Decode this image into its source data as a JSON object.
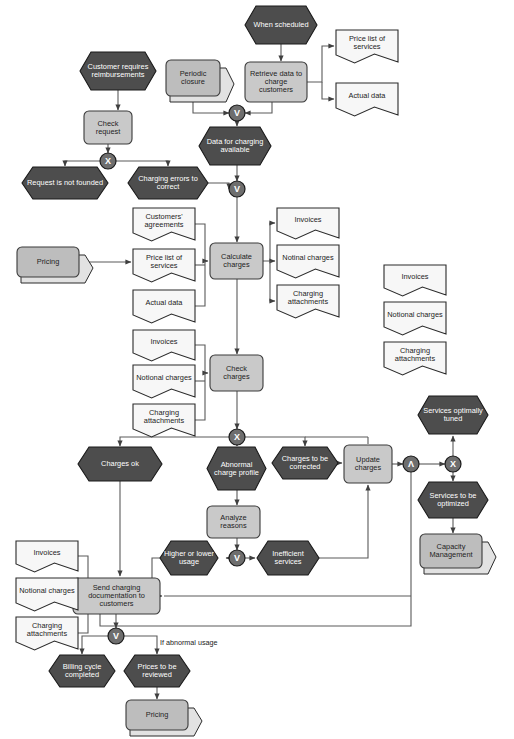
{
  "diagram": {
    "type": "event-driven-process-chain",
    "colors": {
      "event_fill": "#4d4d4d",
      "event_stroke": "#1a1a1a",
      "event_text": "#ffffff",
      "function_fill": "#c9c9c9",
      "function_stroke": "#3a3a3a",
      "function_text": "#1d1d1d",
      "document_fill": "#f7f7f7",
      "document_stroke": "#2b2b2b",
      "system_fill": "#bdbdbd",
      "system_shadow": "#e2e2e2",
      "gateway_fill": "#6e6e6e",
      "gateway_stroke": "#1a1a1a",
      "connector": "#545454",
      "canvas": "#ffffff"
    }
  },
  "events": [
    {
      "id": "ev_customer_requires",
      "label": "Customer requires reimbursements",
      "x": 80,
      "y": 52,
      "w": 76,
      "h": 38
    },
    {
      "id": "ev_when_scheduled",
      "label": "When scheduled",
      "x": 245,
      "y": 6,
      "w": 72,
      "h": 38
    },
    {
      "id": "ev_data_available",
      "label": "Data for charging available",
      "x": 199,
      "y": 127,
      "w": 72,
      "h": 38
    },
    {
      "id": "ev_request_not_founded",
      "label": "Request is not founded",
      "x": 22,
      "y": 167,
      "w": 86,
      "h": 32
    },
    {
      "id": "ev_charging_errors",
      "label": "Charging errors to correct",
      "x": 128,
      "y": 167,
      "w": 80,
      "h": 32
    },
    {
      "id": "ev_charges_ok",
      "label": "Charges ok",
      "x": 78,
      "y": 447,
      "w": 84,
      "h": 34
    },
    {
      "id": "ev_abnormal_profile",
      "label": "Abnormal charge profile",
      "x": 207,
      "y": 447,
      "w": 59,
      "h": 43
    },
    {
      "id": "ev_charges_corrected",
      "label": "Charges to be corrected",
      "x": 272,
      "y": 447,
      "w": 66,
      "h": 32
    },
    {
      "id": "ev_higher_lower",
      "label": "Higher or lower usage",
      "x": 160,
      "y": 541,
      "w": 58,
      "h": 34
    },
    {
      "id": "ev_inefficient",
      "label": "Inefficient services",
      "x": 257,
      "y": 541,
      "w": 62,
      "h": 34
    },
    {
      "id": "ev_services_tuned",
      "label": "Services optimally tuned",
      "x": 418,
      "y": 396,
      "w": 70,
      "h": 38
    },
    {
      "id": "ev_services_optimized",
      "label": "Services to be optimized",
      "x": 418,
      "y": 482,
      "w": 70,
      "h": 36
    },
    {
      "id": "ev_billing_cycle",
      "label": "Billing cycle completed",
      "x": 49,
      "y": 655,
      "w": 66,
      "h": 32
    },
    {
      "id": "ev_prices_reviewed",
      "label": "Prices to be reviewed",
      "x": 124,
      "y": 655,
      "w": 66,
      "h": 32
    }
  ],
  "functions": [
    {
      "id": "fn_check_request",
      "label": "Check request",
      "x": 84,
      "y": 111,
      "w": 48,
      "h": 33
    },
    {
      "id": "fn_retrieve_data",
      "label": "Retrieve data to charge customers",
      "x": 245,
      "y": 62,
      "w": 62,
      "h": 40
    },
    {
      "id": "fn_calculate_charges",
      "label": "Calculate charges",
      "x": 210,
      "y": 243,
      "w": 53,
      "h": 36
    },
    {
      "id": "fn_check_charges",
      "label": "Check charges",
      "x": 210,
      "y": 355,
      "w": 53,
      "h": 36
    },
    {
      "id": "fn_analyze_reasons",
      "label": "Analyze reasons",
      "x": 207,
      "y": 506,
      "w": 53,
      "h": 32
    },
    {
      "id": "fn_update_charges",
      "label": "Update charges",
      "x": 344,
      "y": 445,
      "w": 48,
      "h": 38
    },
    {
      "id": "fn_send_charging_doc",
      "label": "Send charging documentation to customers",
      "x": 73,
      "y": 578,
      "w": 87,
      "h": 36
    }
  ],
  "documents": [
    {
      "id": "doc_price_list_top",
      "label": "Price list of services",
      "x": 336,
      "y": 30,
      "w": 62,
      "h": 32
    },
    {
      "id": "doc_actual_data_top",
      "label": "Actual data",
      "x": 336,
      "y": 83,
      "w": 62,
      "h": 32
    },
    {
      "id": "doc_customers_agr",
      "label": "Customers' agreements",
      "x": 133,
      "y": 208,
      "w": 62,
      "h": 32
    },
    {
      "id": "doc_price_list_mid",
      "label": "Price list of services",
      "x": 133,
      "y": 249,
      "w": 62,
      "h": 32
    },
    {
      "id": "doc_actual_data_mid",
      "label": "Actual data",
      "x": 133,
      "y": 290,
      "w": 62,
      "h": 32
    },
    {
      "id": "doc_invoices_out",
      "label": "Invoices",
      "x": 277,
      "y": 208,
      "w": 62,
      "h": 30
    },
    {
      "id": "doc_notinal_out",
      "label": "Notinal charges",
      "x": 277,
      "y": 245,
      "w": 62,
      "h": 32
    },
    {
      "id": "doc_charging_att_out",
      "label": "Charging attachments",
      "x": 277,
      "y": 285,
      "w": 62,
      "h": 32
    },
    {
      "id": "doc_invoices_in",
      "label": "Invoices",
      "x": 133,
      "y": 330,
      "w": 62,
      "h": 30
    },
    {
      "id": "doc_notional_in",
      "label": "Notional charges",
      "x": 133,
      "y": 365,
      "w": 62,
      "h": 32
    },
    {
      "id": "doc_charging_att_in",
      "label": "Charging attachments",
      "x": 133,
      "y": 404,
      "w": 62,
      "h": 32
    },
    {
      "id": "doc_invoices_right",
      "label": "Invoices",
      "x": 384,
      "y": 265,
      "w": 62,
      "h": 30
    },
    {
      "id": "doc_notional_right",
      "label": "Notional charges",
      "x": 384,
      "y": 302,
      "w": 62,
      "h": 32
    },
    {
      "id": "doc_charging_right",
      "label": "Charging attachments",
      "x": 384,
      "y": 342,
      "w": 62,
      "h": 32
    },
    {
      "id": "doc_invoices_bottom",
      "label": "Invoices",
      "x": 16,
      "y": 541,
      "w": 62,
      "h": 30
    },
    {
      "id": "doc_notional_bottom",
      "label": "Notional charges",
      "x": 16,
      "y": 578,
      "w": 62,
      "h": 32
    },
    {
      "id": "doc_charging_bottom",
      "label": "Charging attachments",
      "x": 16,
      "y": 617,
      "w": 62,
      "h": 32
    }
  ],
  "systems": [
    {
      "id": "sys_periodic_closure",
      "label": "Periodic closure",
      "x": 166,
      "y": 60,
      "w": 54,
      "h": 36
    },
    {
      "id": "sys_pricing_left",
      "label": "Pricing",
      "x": 17,
      "y": 247,
      "w": 62,
      "h": 30
    },
    {
      "id": "sys_capacity_mgmt",
      "label": "Capacity Management",
      "x": 420,
      "y": 534,
      "w": 62,
      "h": 34
    },
    {
      "id": "sys_pricing_bottom",
      "label": "Pricing",
      "x": 126,
      "y": 700,
      "w": 62,
      "h": 30
    }
  ],
  "gateways": [
    {
      "id": "gw_or_top",
      "kind": "OR",
      "glyph": "V",
      "cx": 237,
      "cy": 113
    },
    {
      "id": "gw_xor_request",
      "kind": "XOR",
      "glyph": "X",
      "cx": 108,
      "cy": 161
    },
    {
      "id": "gw_or_errors",
      "kind": "OR",
      "glyph": "V",
      "cx": 237,
      "cy": 189
    },
    {
      "id": "gw_xor_check",
      "kind": "XOR",
      "glyph": "X",
      "cx": 237,
      "cy": 437
    },
    {
      "id": "gw_or_reasons",
      "kind": "OR",
      "glyph": "V",
      "cx": 237,
      "cy": 558
    },
    {
      "id": "gw_and_update",
      "kind": "AND",
      "glyph": "Λ",
      "cx": 411,
      "cy": 464
    },
    {
      "id": "gw_xor_services",
      "kind": "XOR",
      "glyph": "X",
      "cx": 453,
      "cy": 464
    },
    {
      "id": "gw_or_send",
      "kind": "OR",
      "glyph": "V",
      "cx": 116,
      "cy": 636
    }
  ],
  "edge_labels": [
    {
      "id": "lbl_if_abnormal_usage",
      "text": "If abnormal usage",
      "x": 160,
      "y": 638
    }
  ]
}
